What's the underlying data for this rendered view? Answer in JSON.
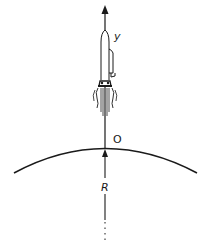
{
  "diagram": {
    "type": "rocket-launch-from-planet-surface",
    "colors": {
      "ink": "#1a1a1a",
      "background": "#ffffff"
    },
    "labels": {
      "y_axis": "y",
      "origin": "O",
      "radius": "R"
    },
    "elements": [
      "vertical y-axis with upward arrow",
      "rocket with exhaust flames on the axis",
      "curved planet surface arc",
      "origin point O at surface",
      "radius line R from planet center (dashed below)"
    ]
  }
}
